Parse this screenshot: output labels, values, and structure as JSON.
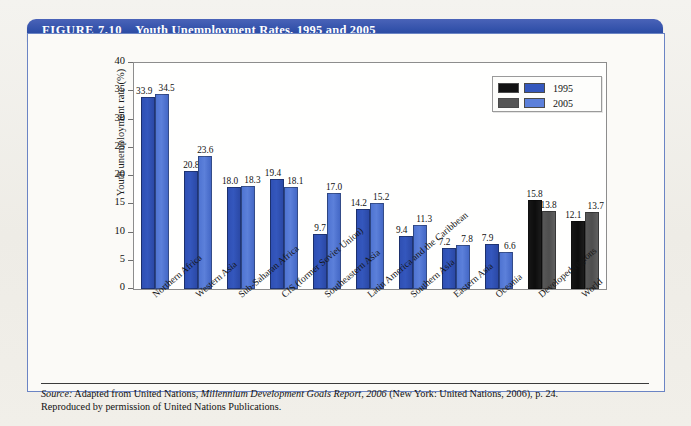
{
  "figure": {
    "number": "FIGURE 7.10",
    "title": "Youth Unemployment Rates, 1995 and 2005"
  },
  "legend": {
    "items": [
      {
        "label": "1995",
        "color_dark": "#111111",
        "color_blue": "#3457bd"
      },
      {
        "label": "2005",
        "color_dark": "#555555",
        "color_blue": "#5c80da"
      }
    ]
  },
  "source": {
    "prefix": "Source:",
    "line1_a": " Adapted from United Nations, ",
    "line1_italic": "Millennium Development Goals Report, 2006",
    "line1_b": " (New York: United Nations, 2006), p. 24.",
    "line2": "Reproduced by permission of United Nations Publications."
  },
  "chart_data": {
    "type": "bar",
    "title": "Youth Unemployment Rates, 1995 and 2005",
    "xlabel": "",
    "ylabel": "Youth unemployment rate (%)",
    "ylim": [
      0,
      40
    ],
    "yticks": [
      0,
      5,
      10,
      15,
      20,
      25,
      30,
      35,
      40
    ],
    "grid": false,
    "legend_position": "top-right",
    "categories": [
      "Northern Africa",
      "Western Asia",
      "Sub-Saharan Africa",
      "CIS (former Soviet Union)",
      "Southeastern Asia",
      "Latin America and the Caribbean",
      "Southern Asia",
      "Eastern Asia",
      "Oceania",
      "Developed regions",
      "World"
    ],
    "series": [
      {
        "name": "1995",
        "values": [
          33.9,
          20.8,
          18.0,
          19.4,
          9.7,
          14.2,
          9.4,
          7.2,
          7.9,
          15.8,
          12.1
        ]
      },
      {
        "name": "2005",
        "values": [
          34.5,
          23.6,
          18.3,
          18.1,
          17.0,
          15.2,
          11.3,
          7.8,
          6.6,
          13.8,
          13.7
        ]
      }
    ],
    "highlight_categories": [
      "Developed regions",
      "World"
    ],
    "highlight_colors": {
      "1995": "#111111",
      "2005": "#555555"
    },
    "default_colors": {
      "1995": "#3457bd",
      "2005": "#5c80da"
    }
  }
}
